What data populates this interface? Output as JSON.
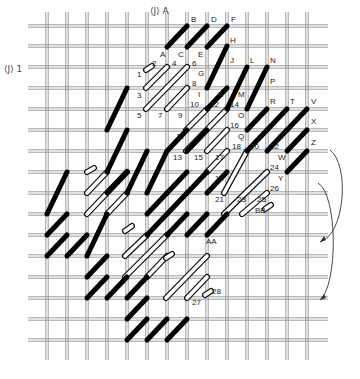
{
  "diagram": {
    "type": "needlepoint-stitch-chart",
    "grid": {
      "cols_x": [
        47,
        67,
        87,
        107,
        127,
        147,
        167,
        187,
        207,
        227,
        247,
        267,
        287,
        307
      ],
      "rows_y": [
        26,
        46,
        67,
        88,
        109,
        130,
        151,
        172,
        193,
        214,
        235,
        256,
        277,
        298,
        319,
        340
      ],
      "v_top": 12,
      "v_bottom": 360,
      "h_left": 28,
      "h_right": 328,
      "thread_color": "#9a9a9a"
    },
    "markers": [
      {
        "text": "⟨J⟩ A",
        "x": 150,
        "y": 14
      },
      {
        "text": "⟨J⟩ 1",
        "x": 4,
        "y": 72
      }
    ],
    "black_stitches": [
      [
        167,
        47,
        187,
        26
      ],
      [
        187,
        47,
        207,
        26
      ],
      [
        207,
        47,
        227,
        26
      ],
      [
        207,
        88,
        227,
        46
      ],
      [
        207,
        109,
        227,
        88
      ],
      [
        227,
        109,
        247,
        67
      ],
      [
        247,
        109,
        267,
        67
      ],
      [
        247,
        130,
        267,
        109
      ],
      [
        247,
        151,
        287,
        109
      ],
      [
        267,
        151,
        287,
        130
      ],
      [
        287,
        130,
        307,
        109
      ],
      [
        287,
        151,
        307,
        130
      ],
      [
        287,
        172,
        307,
        151
      ],
      [
        107,
        130,
        127,
        88
      ],
      [
        107,
        172,
        127,
        130
      ],
      [
        107,
        193,
        127,
        172
      ],
      [
        127,
        193,
        147,
        151
      ],
      [
        147,
        193,
        167,
        151
      ],
      [
        147,
        214,
        167,
        193
      ],
      [
        167,
        193,
        187,
        172
      ],
      [
        147,
        235,
        187,
        193
      ],
      [
        167,
        235,
        187,
        214
      ],
      [
        187,
        235,
        207,
        214
      ],
      [
        207,
        235,
        227,
        214
      ],
      [
        47,
        214,
        67,
        172
      ],
      [
        47,
        235,
        67,
        214
      ],
      [
        47,
        256,
        67,
        235
      ],
      [
        67,
        256,
        87,
        235
      ],
      [
        87,
        256,
        107,
        214
      ],
      [
        87,
        277,
        107,
        256
      ],
      [
        87,
        298,
        107,
        277
      ],
      [
        107,
        298,
        127,
        277
      ],
      [
        127,
        298,
        147,
        277
      ],
      [
        127,
        319,
        147,
        298
      ],
      [
        127,
        340,
        147,
        319
      ],
      [
        147,
        340,
        167,
        319
      ],
      [
        167,
        340,
        187,
        319
      ],
      [
        167,
        151,
        187,
        130
      ],
      [
        187,
        151,
        207,
        130
      ],
      [
        187,
        193,
        207,
        172
      ],
      [
        207,
        193,
        227,
        172
      ]
    ],
    "white_stitches": [
      [
        146,
        70,
        152,
        66
      ],
      [
        146,
        88,
        167,
        67
      ],
      [
        146,
        109,
        187,
        67
      ],
      [
        167,
        109,
        187,
        88
      ],
      [
        186,
        130,
        207,
        109
      ],
      [
        186,
        151,
        227,
        109
      ],
      [
        207,
        151,
        227,
        130
      ],
      [
        207,
        172,
        227,
        151
      ],
      [
        224,
        193,
        247,
        151
      ],
      [
        224,
        214,
        267,
        172
      ],
      [
        242,
        214,
        267,
        193
      ],
      [
        265,
        209,
        271,
        205
      ],
      [
        87,
        172,
        94,
        168
      ],
      [
        87,
        193,
        107,
        172
      ],
      [
        87,
        214,
        127,
        172
      ],
      [
        107,
        214,
        127,
        193
      ],
      [
        125,
        231,
        132,
        226
      ],
      [
        125,
        256,
        147,
        235
      ],
      [
        125,
        277,
        167,
        235
      ],
      [
        147,
        277,
        167,
        256
      ],
      [
        166,
        258,
        172,
        254
      ],
      [
        166,
        298,
        207,
        256
      ],
      [
        187,
        298,
        207,
        277
      ],
      [
        205,
        295,
        211,
        291
      ]
    ],
    "labels": [
      {
        "t": "A",
        "x": 160,
        "y": 57
      },
      {
        "t": "B",
        "x": 191,
        "y": 22
      },
      {
        "t": "C",
        "x": 178,
        "y": 57
      },
      {
        "t": "D",
        "x": 211,
        "y": 22
      },
      {
        "t": "E",
        "x": 198,
        "y": 57
      },
      {
        "t": "F",
        "x": 231,
        "y": 22
      },
      {
        "t": "G",
        "x": 198,
        "y": 76
      },
      {
        "t": "H",
        "x": 230,
        "y": 43
      },
      {
        "t": "I",
        "x": 198,
        "y": 97
      },
      {
        "t": "J",
        "x": 230,
        "y": 63
      },
      {
        "t": "K",
        "x": 218,
        "y": 97
      },
      {
        "t": "L",
        "x": 250,
        "y": 63
      },
      {
        "t": "M",
        "x": 238,
        "y": 97
      },
      {
        "t": "N",
        "x": 270,
        "y": 63
      },
      {
        "t": "O",
        "x": 238,
        "y": 118
      },
      {
        "t": "P",
        "x": 270,
        "y": 84
      },
      {
        "t": "Q",
        "x": 238,
        "y": 139
      },
      {
        "t": "R",
        "x": 270,
        "y": 104
      },
      {
        "t": "S",
        "x": 258,
        "y": 139
      },
      {
        "t": "T",
        "x": 290,
        "y": 104
      },
      {
        "t": "U",
        "x": 278,
        "y": 139
      },
      {
        "t": "V",
        "x": 311,
        "y": 104
      },
      {
        "t": "W",
        "x": 278,
        "y": 160
      },
      {
        "t": "X",
        "x": 311,
        "y": 124
      },
      {
        "t": "Y",
        "x": 278,
        "y": 181
      },
      {
        "t": "Z",
        "x": 311,
        "y": 145
      },
      {
        "t": "AA",
        "x": 206,
        "y": 244
      },
      {
        "t": "BB",
        "x": 255,
        "y": 213
      },
      {
        "t": "1",
        "x": 137,
        "y": 77
      },
      {
        "t": "2",
        "x": 152,
        "y": 66
      },
      {
        "t": "3",
        "x": 137,
        "y": 98
      },
      {
        "t": "4",
        "x": 172,
        "y": 66
      },
      {
        "t": "5",
        "x": 137,
        "y": 118
      },
      {
        "t": "6",
        "x": 192,
        "y": 66
      },
      {
        "t": "7",
        "x": 158,
        "y": 118
      },
      {
        "t": "8",
        "x": 192,
        "y": 86
      },
      {
        "t": "9",
        "x": 178,
        "y": 118
      },
      {
        "t": "10",
        "x": 190,
        "y": 107
      },
      {
        "t": "11",
        "x": 176,
        "y": 139
      },
      {
        "t": "12",
        "x": 210,
        "y": 107
      },
      {
        "t": "13",
        "x": 173,
        "y": 160
      },
      {
        "t": "14",
        "x": 230,
        "y": 107
      },
      {
        "t": "15",
        "x": 194,
        "y": 160
      },
      {
        "t": "16",
        "x": 230,
        "y": 128
      },
      {
        "t": "17",
        "x": 215,
        "y": 160
      },
      {
        "t": "18",
        "x": 232,
        "y": 149
      },
      {
        "t": "19",
        "x": 215,
        "y": 181
      },
      {
        "t": "20",
        "x": 250,
        "y": 149
      },
      {
        "t": "21",
        "x": 215,
        "y": 202
      },
      {
        "t": "22",
        "x": 270,
        "y": 149
      },
      {
        "t": "23",
        "x": 237,
        "y": 202
      },
      {
        "t": "24",
        "x": 270,
        "y": 170
      },
      {
        "t": "25",
        "x": 257,
        "y": 202
      },
      {
        "t": "26",
        "x": 270,
        "y": 191
      },
      {
        "t": "27",
        "x": 192,
        "y": 305
      },
      {
        "t": "28",
        "x": 212,
        "y": 294
      }
    ],
    "arrows": [
      {
        "d": "M330,150 C350,165 345,235 320,242",
        "tip": [
          320,
          242
        ]
      },
      {
        "d": "M318,183 C338,195 338,285 320,300",
        "tip": [
          320,
          300
        ]
      }
    ]
  }
}
